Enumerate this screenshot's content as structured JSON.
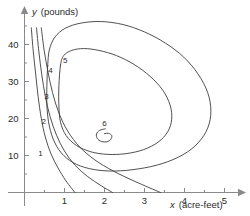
{
  "figure": {
    "kind": "contour-plot",
    "background": "#ffffff",
    "line_color": "#3c3c3c",
    "axis_color": "#8a8a8a",
    "text_color": "#2b2b2b"
  },
  "axes": {
    "x_title_var": "x",
    "x_title_units": "(acre-feet)",
    "y_title_var": "y",
    "y_title_units": "(pounds)",
    "x_ticks": [
      "1",
      "2",
      "3",
      "4",
      "5"
    ],
    "y_ticks": [
      "10",
      "20",
      "30",
      "40"
    ]
  },
  "contour_labels": [
    "1",
    "2",
    "3",
    "4",
    "5",
    "6"
  ],
  "chart_data": {
    "type": "line",
    "subtype": "contour",
    "title": "",
    "xlabel": "x (acre-feet)",
    "ylabel": "y (pounds)",
    "xlim": [
      0,
      5.4
    ],
    "ylim": [
      0,
      47
    ],
    "xticks": [
      1,
      2,
      3,
      4,
      5
    ],
    "yticks": [
      10,
      20,
      30,
      40
    ],
    "xminor_ticks": [
      0.5,
      1.5,
      2.5,
      3.5,
      4.5
    ],
    "yminor_ticks": [
      5,
      15,
      25,
      35,
      45
    ],
    "grid": false,
    "legend": null,
    "levels": [
      1,
      2,
      3,
      4,
      5,
      6
    ],
    "label_positions": [
      {
        "level": "1",
        "x": 0.4,
        "y": 10.0
      },
      {
        "level": "2",
        "x": 0.48,
        "y": 18.5
      },
      {
        "level": "3",
        "x": 0.55,
        "y": 25.4
      },
      {
        "level": "4",
        "x": 0.65,
        "y": 32.2
      },
      {
        "level": "5",
        "x": 1.02,
        "y": 35.1
      },
      {
        "level": "6",
        "x": 2.0,
        "y": 18.1
      }
    ],
    "series": [
      {
        "name": "1",
        "closed": false,
        "points": [
          [
            0.17,
            44.5
          ],
          [
            0.22,
            38.0
          ],
          [
            0.28,
            32.0
          ],
          [
            0.34,
            26.0
          ],
          [
            0.42,
            20.0
          ],
          [
            0.52,
            15.0
          ],
          [
            0.66,
            10.5
          ],
          [
            0.84,
            6.6
          ],
          [
            1.02,
            3.4
          ],
          [
            1.18,
            1.1
          ],
          [
            1.26,
            0.0
          ]
        ]
      },
      {
        "name": "2",
        "closed": false,
        "points": [
          [
            0.3,
            44.5
          ],
          [
            0.36,
            38.0
          ],
          [
            0.43,
            32.0
          ],
          [
            0.52,
            26.0
          ],
          [
            0.64,
            20.5
          ],
          [
            0.8,
            15.5
          ],
          [
            1.0,
            11.2
          ],
          [
            1.26,
            7.4
          ],
          [
            1.58,
            4.3
          ],
          [
            1.92,
            1.8
          ],
          [
            2.2,
            0.0
          ]
        ]
      },
      {
        "name": "3",
        "closed": false,
        "points": [
          [
            0.42,
            44.5
          ],
          [
            0.49,
            38.5
          ],
          [
            0.58,
            33.0
          ],
          [
            0.7,
            27.0
          ],
          [
            0.86,
            21.5
          ],
          [
            1.08,
            16.6
          ],
          [
            1.38,
            12.3
          ],
          [
            1.76,
            8.8
          ],
          [
            2.22,
            5.8
          ],
          [
            2.76,
            3.0
          ],
          [
            3.4,
            0.0
          ]
        ]
      },
      {
        "name": "4",
        "closed": true,
        "points": [
          [
            0.58,
            34.2
          ],
          [
            0.62,
            38.5
          ],
          [
            0.76,
            42.0
          ],
          [
            1.02,
            44.4
          ],
          [
            1.42,
            45.8
          ],
          [
            1.92,
            46.2
          ],
          [
            2.46,
            45.4
          ],
          [
            3.0,
            43.4
          ],
          [
            3.52,
            40.4
          ],
          [
            3.98,
            36.6
          ],
          [
            4.34,
            32.0
          ],
          [
            4.58,
            27.0
          ],
          [
            4.66,
            22.0
          ],
          [
            4.58,
            17.4
          ],
          [
            4.34,
            13.4
          ],
          [
            3.96,
            10.2
          ],
          [
            3.44,
            7.8
          ],
          [
            2.86,
            6.4
          ],
          [
            2.26,
            5.8
          ],
          [
            1.74,
            6.2
          ],
          [
            1.3,
            7.6
          ],
          [
            0.98,
            10.0
          ],
          [
            0.76,
            13.4
          ],
          [
            0.62,
            18.0
          ],
          [
            0.56,
            23.4
          ],
          [
            0.56,
            29.0
          ]
        ]
      },
      {
        "name": "5",
        "closed": true,
        "points": [
          [
            0.9,
            34.4
          ],
          [
            0.98,
            37.0
          ],
          [
            1.18,
            38.4
          ],
          [
            1.48,
            38.9
          ],
          [
            1.86,
            38.4
          ],
          [
            2.3,
            37.0
          ],
          [
            2.74,
            34.6
          ],
          [
            3.14,
            31.4
          ],
          [
            3.46,
            27.6
          ],
          [
            3.64,
            23.6
          ],
          [
            3.68,
            19.8
          ],
          [
            3.58,
            16.4
          ],
          [
            3.34,
            13.6
          ],
          [
            2.98,
            11.6
          ],
          [
            2.54,
            10.5
          ],
          [
            2.08,
            10.3
          ],
          [
            1.66,
            11.0
          ],
          [
            1.3,
            12.7
          ],
          [
            1.04,
            15.4
          ],
          [
            0.9,
            19.0
          ],
          [
            0.86,
            23.4
          ],
          [
            0.86,
            28.8
          ]
        ]
      },
      {
        "name": "6",
        "closed": false,
        "points": [
          [
            2.02,
            17.2
          ],
          [
            1.88,
            16.8
          ],
          [
            1.8,
            15.8
          ],
          [
            1.82,
            14.6
          ],
          [
            1.92,
            13.8
          ],
          [
            2.06,
            13.7
          ],
          [
            2.16,
            14.4
          ],
          [
            2.18,
            15.4
          ],
          [
            2.1,
            16.0
          ],
          [
            2.0,
            15.9
          ]
        ]
      }
    ]
  }
}
